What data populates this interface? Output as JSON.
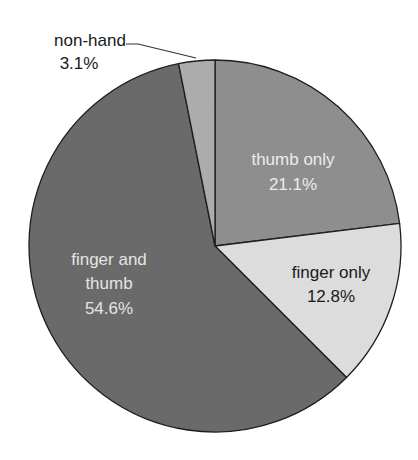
{
  "chart_data": {
    "type": "pie",
    "title": "",
    "slices": [
      {
        "label": "thumb only",
        "value": 21.1,
        "display": "21.1%",
        "color": "#8e8e8e",
        "text_color": "#ececec",
        "start_deg": -90,
        "end_deg": -7
      },
      {
        "label": "finger only",
        "value": 12.8,
        "display": "12.8%",
        "color": "#dcdcdc",
        "text_color": "#1a1a1a",
        "start_deg": -7,
        "end_deg": 45
      },
      {
        "label": "finger and thumb",
        "value": 54.6,
        "display": "54.6%",
        "color": "#6a6a6a",
        "text_color": "#e4e4e4",
        "start_deg": 45,
        "end_deg": 258.7
      },
      {
        "label": "non-hand",
        "value": 3.1,
        "display": "3.1%",
        "color": "#acacac",
        "text_color": "#1a1a1a",
        "start_deg": 258.7,
        "end_deg": 270
      }
    ]
  },
  "labels": {
    "thumb_only": {
      "line1": "thumb only",
      "line2": "21.1%"
    },
    "finger_only": {
      "line1": "finger only",
      "line2": "12.8%"
    },
    "finger_and_thumb": {
      "line1": "finger and",
      "line2": "thumb",
      "line3": "54.6%"
    },
    "non_hand": {
      "line1": "non-hand",
      "line2": "3.1%"
    }
  }
}
